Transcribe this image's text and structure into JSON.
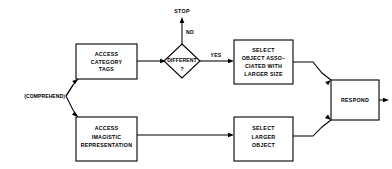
{
  "diagram": {
    "type": "flowchart",
    "title": "",
    "entry": {
      "label": "(COMPREHEND)"
    },
    "terminals": [
      {
        "id": "stop",
        "label": "STOP"
      }
    ],
    "nodes": [
      {
        "id": "access-category-tags",
        "shape": "rectangle",
        "lines": [
          "ACCESS",
          "CATEGORY",
          "TAGS"
        ]
      },
      {
        "id": "different",
        "shape": "diamond",
        "lines": [
          "DIFFERENT",
          "?"
        ]
      },
      {
        "id": "select-object-associated",
        "shape": "rectangle",
        "lines": [
          "SELECT",
          "OBJECT ASSO–",
          "CIATED WITH",
          "LARGER SIZE"
        ]
      },
      {
        "id": "access-imagistic-representation",
        "shape": "rectangle",
        "lines": [
          "ACCESS",
          "IMAGISTIC",
          "REPRESENTATION"
        ]
      },
      {
        "id": "select-larger-object",
        "shape": "rectangle",
        "lines": [
          "SELECT",
          "LARGER",
          "OBJECT"
        ]
      },
      {
        "id": "respond",
        "shape": "rectangle",
        "lines": [
          "RESPOND"
        ]
      }
    ],
    "edge_labels": {
      "no": "NO",
      "yes": "YES"
    },
    "colors": {
      "stroke": "#000000",
      "fill": "#ffffff",
      "background": "#ffffff"
    }
  }
}
